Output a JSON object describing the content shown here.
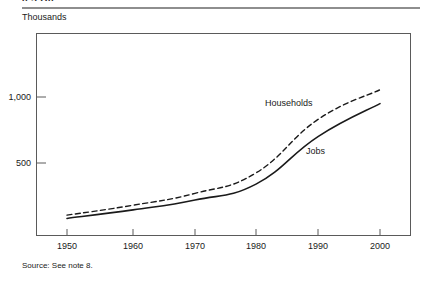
{
  "page": {
    "clipped_running_head": "0.3 D0",
    "unit_label": "Thousands",
    "source_note": "Source: See note 8."
  },
  "chart_data": {
    "type": "line",
    "title": "",
    "subtitle": "",
    "xlabel": "",
    "ylabel": "Thousands",
    "x": [
      1950,
      1960,
      1970,
      1980,
      1990,
      2000
    ],
    "categories": [
      "1950",
      "1960",
      "1970",
      "1980",
      "1990",
      "2000"
    ],
    "series": [
      {
        "name": "Households",
        "style": "dashed",
        "color": "#1a1a1a",
        "values": [
          105,
          180,
          270,
          425,
          830,
          1055
        ]
      },
      {
        "name": "Jobs",
        "style": "solid",
        "color": "#1a1a1a",
        "values": [
          80,
          145,
          220,
          340,
          700,
          950
        ]
      }
    ],
    "ylim": [
      0,
      1250
    ],
    "yticks": [
      500,
      1000
    ],
    "ytick_labels": [
      "500",
      "1,000"
    ],
    "xlim": [
      1945,
      2005
    ],
    "xticks": [
      1950,
      1960,
      1970,
      1980,
      1990,
      2000
    ],
    "xtick_labels": [
      "1950",
      "1960",
      "1970",
      "1980",
      "1990",
      "2000"
    ],
    "grid": false,
    "legend_position": "inline-annotations",
    "annotations": [
      {
        "text": "Households",
        "series": "Households"
      },
      {
        "text": "Jobs",
        "series": "Jobs"
      }
    ]
  },
  "geometry": {
    "plot_left": 36,
    "plot_top": 33,
    "plot_right": 411,
    "plot_bottom": 236,
    "y_zero_px": 229,
    "y_500_px": 163,
    "y_1000_px": 97,
    "x_px": [
      67,
      133,
      195,
      256,
      318,
      380
    ]
  }
}
